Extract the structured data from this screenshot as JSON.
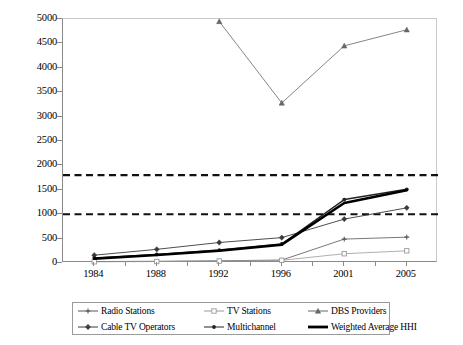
{
  "chart_data": {
    "type": "line",
    "title": "",
    "xlabel": "",
    "ylabel": "",
    "categories": [
      "1984",
      "1988",
      "1992",
      "1996",
      "2001",
      "2005"
    ],
    "ylim": [
      0,
      5000
    ],
    "yticks": [
      0,
      500,
      1000,
      1500,
      2000,
      2500,
      3000,
      3500,
      4000,
      4500,
      5000
    ],
    "grid": false,
    "legend_position": "bottom",
    "reference_lines": [
      {
        "name": "hhi-1800-threshold",
        "value": 1800,
        "style": "dashed"
      },
      {
        "name": "hhi-1000-threshold",
        "value": 1000,
        "style": "dashed"
      }
    ],
    "series": [
      {
        "name": "Radio Stations",
        "marker": "cross",
        "color": "#555555",
        "width": 0.8,
        "values": [
          30,
          35,
          45,
          60,
          490,
          530
        ]
      },
      {
        "name": "TV Stations",
        "marker": "square-open",
        "color": "#9a9a9a",
        "width": 0.8,
        "values": [
          25,
          30,
          40,
          55,
          190,
          250
        ]
      },
      {
        "name": "DBS Providers",
        "marker": "triangle",
        "color": "#666666",
        "width": 0.8,
        "values": [
          null,
          null,
          4950,
          3280,
          4450,
          4780
        ]
      },
      {
        "name": "Cable TV Operators",
        "marker": "diamond",
        "color": "#3a3a3a",
        "width": 0.9,
        "values": [
          160,
          280,
          420,
          520,
          900,
          1130
        ]
      },
      {
        "name": "Multichannel",
        "marker": "dot",
        "color": "#222222",
        "width": 1.4,
        "values": [
          100,
          175,
          265,
          390,
          1300,
          1510
        ]
      },
      {
        "name": "Weighted Average HHI",
        "marker": "none",
        "color": "#000000",
        "width": 2.6,
        "values": [
          90,
          165,
          250,
          375,
          1230,
          1490
        ]
      }
    ]
  },
  "axes": {
    "y_tick_labels": [
      "5000",
      "4500",
      "4000",
      "3500",
      "3000",
      "2500",
      "2000",
      "1500",
      "1000",
      "500",
      "0"
    ],
    "x_tick_labels": [
      "1984",
      "1988",
      "1992",
      "1996",
      "2001",
      "2005"
    ]
  },
  "legend": {
    "entries": [
      {
        "label": "Radio Stations",
        "marker": "cross-icon"
      },
      {
        "label": "TV Stations",
        "marker": "square-open-icon"
      },
      {
        "label": "DBS Providers",
        "marker": "triangle-icon"
      },
      {
        "label": "Cable TV Operators",
        "marker": "diamond-icon"
      },
      {
        "label": "Multichannel",
        "marker": "dot-icon"
      },
      {
        "label": "Weighted Average HHI",
        "marker": "thick-line-icon"
      }
    ]
  }
}
